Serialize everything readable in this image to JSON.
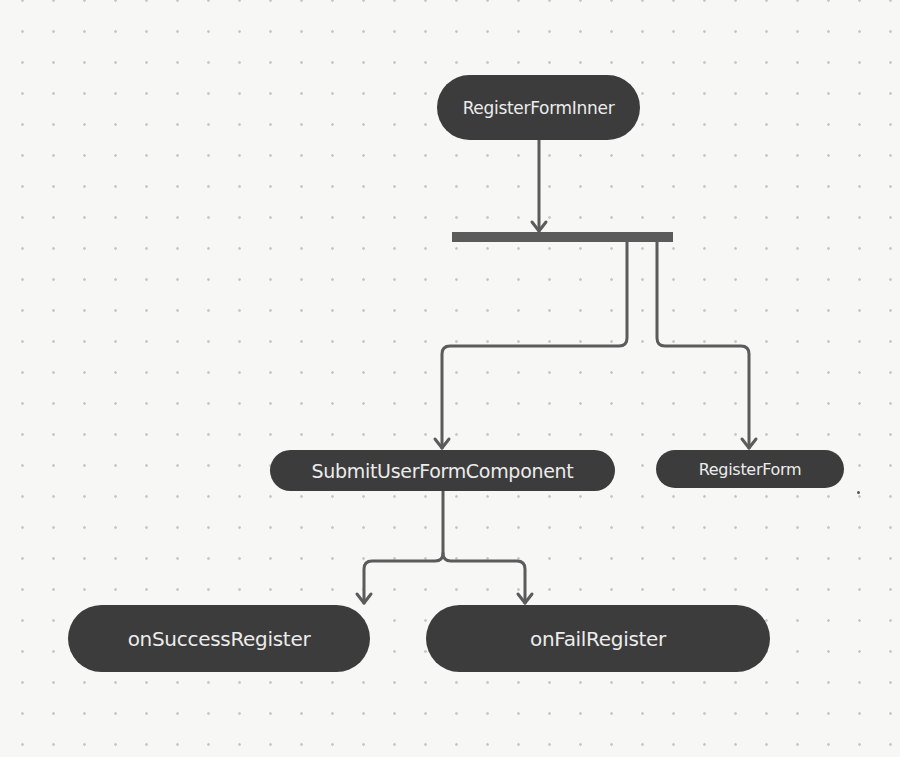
{
  "diagram": {
    "title": "",
    "colors": {
      "node_fill": "#3c3c3c",
      "node_text": "#ececec",
      "edge": "#5b5b5b",
      "background": "#f7f7f5",
      "grid_dot": "#c9c9c7"
    },
    "nodes": [
      {
        "id": "register-form-inner",
        "label": "RegisterFormInner"
      },
      {
        "id": "submit-user-form-component",
        "label": "SubmitUserFormComponent"
      },
      {
        "id": "register-form",
        "label": "RegisterForm"
      },
      {
        "id": "on-success-register",
        "label": "onSuccessRegister"
      },
      {
        "id": "on-fail-register",
        "label": "onFailRegister"
      }
    ],
    "fork": {
      "id": "fork-bar",
      "type": "parallel-fork"
    },
    "edges": [
      {
        "from": "RegisterFormInner",
        "to": "fork-bar"
      },
      {
        "from": "fork-bar",
        "to": "SubmitUserFormComponent"
      },
      {
        "from": "fork-bar",
        "to": "RegisterForm"
      },
      {
        "from": "SubmitUserFormComponent",
        "to": "onSuccessRegister"
      },
      {
        "from": "SubmitUserFormComponent",
        "to": "onFailRegister"
      }
    ]
  }
}
